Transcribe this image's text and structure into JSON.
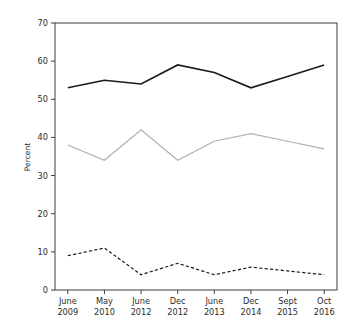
{
  "chart_data": {
    "type": "line",
    "title": "",
    "xlabel": "",
    "ylabel": "Percent",
    "ylim": [
      0,
      70
    ],
    "ytick_step": 10,
    "yticks": [
      "0",
      "10",
      "20",
      "30",
      "40",
      "50",
      "60",
      "70"
    ],
    "grid": false,
    "legend": "none",
    "categories": [
      "June\n2009",
      "May\n2010",
      "June\n2012",
      "Dec\n2012",
      "June\n2013",
      "Dec\n2014",
      "Sept\n2015",
      "Oct\n2016"
    ],
    "category_lines": [
      [
        "June",
        "2009"
      ],
      [
        "May",
        "2010"
      ],
      [
        "June",
        "2012"
      ],
      [
        "Dec",
        "2012"
      ],
      [
        "June",
        "2013"
      ],
      [
        "Dec",
        "2014"
      ],
      [
        "Sept",
        "2015"
      ],
      [
        "Oct",
        "2016"
      ]
    ],
    "series": [
      {
        "name": "series-solid-dark",
        "style": "solid",
        "color": "#1a1a1a",
        "width": 1.6,
        "values": [
          53,
          55,
          54,
          59,
          57,
          53,
          56,
          59
        ]
      },
      {
        "name": "series-solid-light",
        "style": "solid",
        "color": "#b0b0b0",
        "width": 1.2,
        "values": [
          38,
          34,
          42,
          34,
          39,
          41,
          39,
          37
        ]
      },
      {
        "name": "series-dashed-dark",
        "style": "dashed",
        "color": "#1a1a1a",
        "width": 1.2,
        "dasharray": "3.2,2.2",
        "values": [
          9,
          11,
          4,
          7,
          4,
          6,
          5,
          4
        ]
      }
    ]
  },
  "plot": {
    "left": 55,
    "right": 337,
    "top": 23,
    "bottom": 290
  }
}
